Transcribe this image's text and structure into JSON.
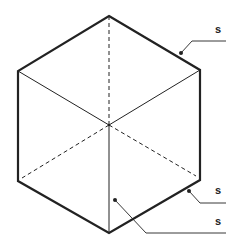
{
  "diagram": {
    "type": "isometric-cube",
    "colors": {
      "line": "#222222",
      "background": "#ffffff"
    },
    "vertices": {
      "top": [
        109,
        16
      ],
      "upper_left": [
        18,
        71
      ],
      "upper_right": [
        200,
        70
      ],
      "center": [
        109,
        125
      ],
      "lower_left": [
        18,
        181
      ],
      "lower_right": [
        200,
        180
      ],
      "bottom": [
        109,
        233
      ]
    },
    "labels": [
      {
        "id": "label-top-right-edge",
        "text": "s"
      },
      {
        "id": "label-bottom-right-edge",
        "text": "s"
      },
      {
        "id": "label-front-face",
        "text": "s"
      }
    ]
  }
}
